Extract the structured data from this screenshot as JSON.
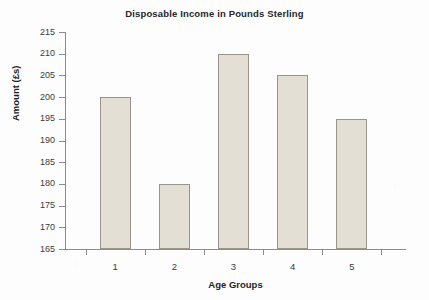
{
  "chart_data": {
    "type": "bar",
    "title": "Disposable Income in Pounds Sterling",
    "xlabel": "Age Groups",
    "ylabel": "Amount (£s)",
    "categories": [
      "1",
      "2",
      "3",
      "4",
      "5"
    ],
    "values": [
      200,
      180,
      210,
      205,
      195
    ],
    "ylim": [
      165,
      215
    ],
    "ytick_step": 5,
    "ytick_labels": [
      "215",
      "210",
      "205",
      "200",
      "195",
      "190",
      "185",
      "180",
      "175",
      "170",
      "165"
    ],
    "grid": false,
    "legend": false,
    "series": [
      {
        "name": "Disposable Income",
        "values": [
          200,
          180,
          210,
          205,
          195
        ]
      }
    ],
    "colors": {
      "bar_fill": "#E3DFD4",
      "bar_border": "#9A948A",
      "axis": "#8C8C8C",
      "text": "#26262B",
      "background": "#FDFDFD"
    }
  }
}
